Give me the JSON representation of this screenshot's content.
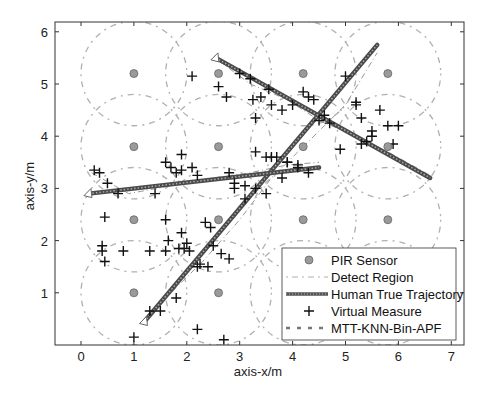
{
  "chart_data": {
    "type": "scatter",
    "title": "",
    "xlabel": "axis-x/m",
    "ylabel": "axis-y/m",
    "xlim": [
      -0.5,
      7.2
    ],
    "ylim": [
      0,
      6.2
    ],
    "xticks": [
      0,
      1,
      2,
      3,
      4,
      5,
      6,
      7
    ],
    "yticks": [
      1,
      2,
      3,
      4,
      5,
      6
    ],
    "grid": false,
    "legend_position": "lower right",
    "legend": [
      "PIR Sensor",
      "Detect Region",
      "Human True Trajectory",
      "Virtual Measure",
      "MTT-KNN-Bin-APF"
    ],
    "sensors": {
      "x": [
        1.0,
        2.6,
        4.2,
        5.8
      ],
      "y": [
        1.0,
        2.4,
        3.8,
        5.2
      ],
      "detect_radius": 1.0
    },
    "series": [
      {
        "name": "Human True Trajectory",
        "type": "line",
        "tracks": [
          {
            "x": [
              1.2,
              5.6
            ],
            "y": [
              0.45,
              5.75
            ]
          },
          {
            "x": [
              2.55,
              6.6
            ],
            "y": [
              5.5,
              3.2
            ]
          },
          {
            "x": [
              0.15,
              4.5
            ],
            "y": [
              2.9,
              3.4
            ]
          }
        ]
      },
      {
        "name": "Virtual Measure",
        "type": "scatter",
        "x": [
          0.25,
          0.35,
          0.5,
          0.7,
          0.45,
          0.4,
          0.4,
          0.45,
          0.8,
          1.3,
          1.6,
          1.6,
          1.65,
          1.9,
          1.95,
          2.0,
          2.05,
          1.85,
          2.2,
          2.35,
          2.45,
          2.5,
          2.25,
          2.4,
          2.65,
          2.8,
          1.8,
          1.5,
          1.3,
          1.0,
          2.2,
          2.7,
          1.4,
          1.7,
          1.9,
          1.6,
          1.9,
          2.1,
          2.8,
          2.9,
          3.1,
          3.3,
          3.5,
          3.3,
          3.7,
          3.9,
          4.1,
          4.3,
          3.5,
          3.8,
          2.1,
          2.6,
          2.75,
          3.0,
          3.2,
          3.25,
          3.4,
          3.55,
          3.6,
          3.8,
          4.0,
          4.3,
          4.5,
          4.7,
          4.9,
          5.2,
          5.3,
          5.5,
          5.65,
          5.8,
          5.0,
          5.2,
          5.3,
          6.0,
          5.9,
          4.2,
          4.4,
          4.6,
          5.4,
          5.5,
          3.3,
          3.6,
          3.9,
          4.1,
          2.9,
          3.1,
          1.8,
          2.2
        ],
        "y": [
          3.35,
          3.3,
          3.1,
          2.9,
          2.45,
          1.9,
          1.8,
          1.6,
          1.8,
          1.8,
          1.8,
          2.4,
          2.0,
          2.15,
          1.85,
          1.95,
          1.8,
          1.85,
          1.5,
          2.35,
          2.25,
          1.9,
          1.55,
          1.5,
          1.75,
          1.65,
          0.9,
          0.65,
          0.65,
          0.15,
          0.3,
          0.1,
          2.9,
          3.4,
          3.35,
          3.5,
          3.65,
          3.4,
          3.3,
          3.1,
          3.05,
          3.0,
          2.9,
          3.7,
          3.6,
          3.5,
          3.4,
          3.3,
          3.6,
          3.2,
          5.15,
          4.95,
          4.75,
          5.2,
          5.1,
          4.7,
          4.75,
          4.9,
          4.6,
          4.5,
          4.6,
          4.75,
          4.3,
          4.25,
          3.75,
          4.6,
          3.85,
          4.1,
          4.5,
          4.2,
          5.15,
          4.65,
          4.35,
          4.2,
          3.85,
          4.85,
          4.7,
          4.4,
          3.9,
          4.0,
          4.35,
          3.6,
          3.5,
          3.45,
          3.0,
          2.8,
          3.3,
          3.25
        ]
      },
      {
        "name": "MTT-KNN-Bin-APF",
        "type": "line-dashed",
        "tracks": [
          {
            "x": [
              1.2,
              1.9,
              2.3,
              3.0,
              3.6,
              4.3,
              5.0,
              5.6
            ],
            "y": [
              0.5,
              1.2,
              1.6,
              2.4,
              3.2,
              3.9,
              4.6,
              5.6
            ]
          },
          {
            "x": [
              2.6,
              3.2,
              3.9,
              4.5,
              5.2,
              5.8,
              6.6
            ],
            "y": [
              5.45,
              5.0,
              4.7,
              4.3,
              4.0,
              3.7,
              3.25
            ]
          },
          {
            "x": [
              0.2,
              0.9,
              1.7,
              2.5,
              3.2,
              3.9,
              4.5
            ],
            "y": [
              3.3,
              2.9,
              3.05,
              3.2,
              3.3,
              3.45,
              3.5
            ]
          }
        ]
      }
    ]
  },
  "legend": {
    "items": [
      {
        "label": "PIR Sensor"
      },
      {
        "label": "Detect Region"
      },
      {
        "label": "Human True Trajectory"
      },
      {
        "label": "Virtual Measure"
      },
      {
        "label": "MTT-KNN-Bin-APF"
      }
    ]
  },
  "axes": {
    "xlabel": "axis-x/m",
    "ylabel": "axis-y/m",
    "xtick_labels": [
      "0",
      "1",
      "2",
      "3",
      "4",
      "5",
      "6",
      "7"
    ],
    "ytick_labels": [
      "1",
      "2",
      "3",
      "4",
      "5",
      "6"
    ]
  },
  "colors": {
    "axis": "#333333",
    "sensor": "#8a8a8a",
    "detect_region": "#b0b0b0",
    "trajectory": "#555555",
    "measure": "#111111",
    "estimate": "#777777"
  }
}
